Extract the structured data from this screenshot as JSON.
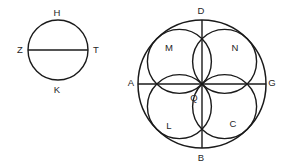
{
  "figure": {
    "background_color": "#ffffff",
    "stroke_color": "#1a1a1a",
    "label_color": "#262626"
  },
  "left_figure": {
    "name": "circle-with-diameter",
    "circle": {
      "cx": 58,
      "cy": 50,
      "r": 30,
      "stroke_width": 1.4
    },
    "diameter": {
      "x1": 28,
      "y1": 50,
      "x2": 88,
      "y2": 50,
      "stroke_width": 1.6
    },
    "labels": [
      {
        "id": "H",
        "text": "H",
        "x": 57,
        "y": 13
      },
      {
        "id": "Z",
        "text": "Z",
        "x": 20,
        "y": 50
      },
      {
        "id": "T",
        "text": "T",
        "x": 96,
        "y": 50
      },
      {
        "id": "K",
        "text": "K",
        "x": 57,
        "y": 90
      }
    ]
  },
  "right_figure": {
    "name": "rosette-in-circle",
    "outer_circle": {
      "cx": 202,
      "cy": 84,
      "r": 64,
      "stroke_width": 1.5
    },
    "horizontal_diameter": {
      "x1": 138,
      "y1": 84,
      "x2": 266,
      "y2": 84,
      "stroke_width": 1.4
    },
    "vertical_diameter": {
      "x1": 202,
      "y1": 20,
      "x2": 202,
      "y2": 148,
      "stroke_width": 1.4
    },
    "petal_circles": [
      {
        "id": "petal-upper-left",
        "cx": 179.4,
        "cy": 61.4,
        "r": 32,
        "stroke_width": 1.4
      },
      {
        "id": "petal-upper-right",
        "cx": 224.6,
        "cy": 61.4,
        "r": 32,
        "stroke_width": 1.4
      },
      {
        "id": "petal-lower-right",
        "cx": 224.6,
        "cy": 106.6,
        "r": 32,
        "stroke_width": 1.4
      },
      {
        "id": "petal-lower-left",
        "cx": 179.4,
        "cy": 106.6,
        "r": 32,
        "stroke_width": 1.4
      }
    ],
    "labels": [
      {
        "id": "D",
        "text": "D",
        "x": 201,
        "y": 11
      },
      {
        "id": "M",
        "text": "M",
        "x": 169,
        "y": 48
      },
      {
        "id": "N",
        "text": "N",
        "x": 235,
        "y": 48
      },
      {
        "id": "A",
        "text": "A",
        "x": 131,
        "y": 83
      },
      {
        "id": "G",
        "text": "G",
        "x": 272,
        "y": 83
      },
      {
        "id": "Q",
        "text": "Q",
        "x": 194,
        "y": 98
      },
      {
        "id": "L",
        "text": "L",
        "x": 169,
        "y": 126
      },
      {
        "id": "C",
        "text": "C",
        "x": 233,
        "y": 124
      },
      {
        "id": "B",
        "text": "B",
        "x": 201,
        "y": 158
      }
    ]
  }
}
